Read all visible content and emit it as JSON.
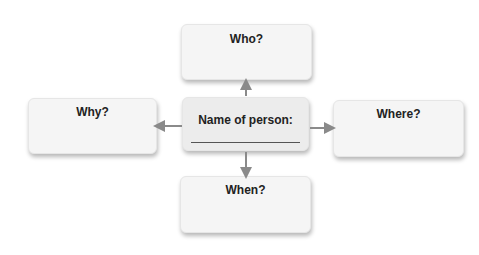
{
  "diagram": {
    "center": {
      "label": "Name of person:"
    },
    "nodes": {
      "top": {
        "label": "Who?"
      },
      "left": {
        "label": "Why?"
      },
      "right": {
        "label": "Where?"
      },
      "bottom": {
        "label": "When?"
      }
    },
    "colors": {
      "box": "#f5f5f5",
      "center_box": "#ececec",
      "arrow": "#8a8a8a",
      "text": "#222222"
    }
  }
}
